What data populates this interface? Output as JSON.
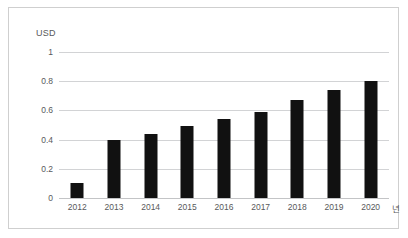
{
  "chart_data": {
    "type": "bar",
    "title": "",
    "subtitle": "",
    "xlabel": "년",
    "ylabel": "USD",
    "categories": [
      "2012",
      "2013",
      "2014",
      "2015",
      "2016",
      "2017",
      "2018",
      "2019",
      "2020"
    ],
    "values": [
      0.1,
      0.4,
      0.44,
      0.49,
      0.54,
      0.59,
      0.67,
      0.74,
      0.8
    ],
    "series": [
      {
        "name": "USD",
        "values": [
          0.1,
          0.4,
          0.44,
          0.49,
          0.54,
          0.59,
          0.67,
          0.74,
          0.8
        ]
      }
    ],
    "ylim": [
      0,
      1
    ],
    "yticks": [
      "0",
      "0.2",
      "0.4",
      "0.6",
      "0.8",
      "1"
    ],
    "ytick_values": [
      0,
      0.2,
      0.4,
      0.6,
      0.8,
      1
    ],
    "grid": true,
    "legend": false,
    "legend_position": "none",
    "bar_color": "#111111",
    "gridline_color": "#d2d3d5",
    "text_color": "#58595b",
    "background_color": "#ffffff",
    "border_color": "#cfcfcf"
  }
}
